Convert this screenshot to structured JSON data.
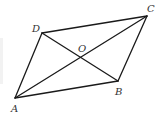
{
  "figure": {
    "type": "parallelogram-with-diagonals",
    "stroke_color": "#1a1a1a",
    "label_color": "#333333",
    "vertices": [
      {
        "name": "A",
        "x": 15,
        "y": 98,
        "label_x": 11,
        "label_y": 112
      },
      {
        "name": "B",
        "x": 118,
        "y": 81,
        "label_x": 115,
        "label_y": 95
      },
      {
        "name": "C",
        "x": 147,
        "y": 16,
        "label_x": 147,
        "label_y": 12
      },
      {
        "name": "D",
        "x": 42,
        "y": 33,
        "label_x": 32,
        "label_y": 32
      },
      {
        "name": "O",
        "x": 81,
        "y": 57,
        "label_x": 78,
        "label_y": 52
      }
    ],
    "sides": [
      {
        "from": "A",
        "to": "B"
      },
      {
        "from": "B",
        "to": "C"
      },
      {
        "from": "C",
        "to": "D"
      },
      {
        "from": "D",
        "to": "A"
      }
    ],
    "diagonals": [
      {
        "from": "A",
        "to": "C"
      },
      {
        "from": "B",
        "to": "D"
      }
    ],
    "labels": {
      "A": "A",
      "B": "B",
      "C": "C",
      "D": "D",
      "O": "O"
    }
  }
}
